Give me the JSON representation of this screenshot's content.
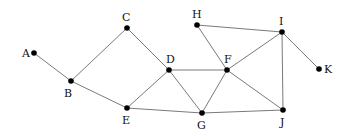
{
  "diagram": {
    "type": "undirected-graph",
    "nodes": [
      {
        "id": "A",
        "label": "A",
        "x": 34,
        "y": 53,
        "lx": 22,
        "ly": 57
      },
      {
        "id": "B",
        "label": "B",
        "x": 71,
        "y": 81,
        "lx": 64,
        "ly": 97
      },
      {
        "id": "C",
        "label": "C",
        "x": 127,
        "y": 28,
        "lx": 122,
        "ly": 21
      },
      {
        "id": "D",
        "label": "D",
        "x": 169,
        "y": 70,
        "lx": 166,
        "ly": 63
      },
      {
        "id": "E",
        "label": "E",
        "x": 127,
        "y": 108,
        "lx": 122,
        "ly": 124
      },
      {
        "id": "F",
        "label": "F",
        "x": 227,
        "y": 70,
        "lx": 224,
        "ly": 63
      },
      {
        "id": "G",
        "label": "G",
        "x": 202,
        "y": 113,
        "lx": 197,
        "ly": 129
      },
      {
        "id": "H",
        "label": "H",
        "x": 197,
        "y": 25,
        "lx": 192,
        "ly": 18
      },
      {
        "id": "I",
        "label": "I",
        "x": 282,
        "y": 32,
        "lx": 279,
        "ly": 25
      },
      {
        "id": "J",
        "label": "J",
        "x": 283,
        "y": 110,
        "lx": 280,
        "ly": 126
      },
      {
        "id": "K",
        "label": "K",
        "x": 319,
        "y": 69,
        "lx": 324,
        "ly": 73
      }
    ],
    "edges": [
      [
        "A",
        "B"
      ],
      [
        "B",
        "C"
      ],
      [
        "B",
        "E"
      ],
      [
        "C",
        "D"
      ],
      [
        "D",
        "E"
      ],
      [
        "D",
        "F"
      ],
      [
        "D",
        "G"
      ],
      [
        "E",
        "G"
      ],
      [
        "F",
        "G"
      ],
      [
        "F",
        "H"
      ],
      [
        "F",
        "I"
      ],
      [
        "F",
        "J"
      ],
      [
        "G",
        "J"
      ],
      [
        "H",
        "I"
      ],
      [
        "I",
        "J"
      ],
      [
        "I",
        "K"
      ]
    ]
  }
}
